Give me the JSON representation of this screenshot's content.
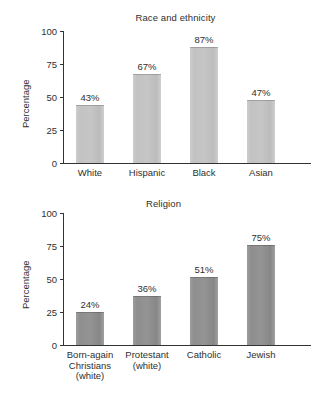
{
  "figure": {
    "background": "#ffffff",
    "axis_color": "#333333",
    "text_color": "#2f2f2f"
  },
  "panels": [
    {
      "id": "race",
      "title": "Race and ethnicity",
      "ylabel": "Percentage",
      "bar_color": "#c4c4c4",
      "ticks": [
        "0",
        "25",
        "50",
        "75",
        "100"
      ],
      "categories": [
        "White",
        "Hispanic",
        "Black",
        "Asian"
      ],
      "values": [
        43,
        67,
        87,
        47
      ],
      "value_labels": [
        "43%",
        "67%",
        "87%",
        "47%"
      ]
    },
    {
      "id": "religion",
      "title": "Religion",
      "ylabel": "Percentage",
      "bar_color": "#909090",
      "ticks": [
        "0",
        "25",
        "50",
        "75",
        "100"
      ],
      "categories": [
        "Born-again\nChristians\n(white)",
        "Protestant\n(white)",
        "Catholic",
        "Jewish"
      ],
      "values": [
        24,
        36,
        51,
        75
      ],
      "value_labels": [
        "24%",
        "36%",
        "51%",
        "75%"
      ]
    }
  ],
  "chart_data": [
    {
      "type": "bar",
      "title": "Race and ethnicity",
      "xlabel": "",
      "ylabel": "Percentage",
      "categories": [
        "White",
        "Hispanic",
        "Black",
        "Asian"
      ],
      "values": [
        43,
        67,
        87,
        47
      ],
      "data_labels": [
        "43%",
        "67%",
        "87%",
        "47%"
      ],
      "ylim": [
        0,
        100
      ],
      "ytick_values": [
        0,
        25,
        50,
        75,
        100
      ],
      "ytick_labels": [
        "0",
        "25",
        "50",
        "75",
        "100"
      ],
      "grid": false,
      "legend": false,
      "bar_color": "#c4c4c4"
    },
    {
      "type": "bar",
      "title": "Religion",
      "xlabel": "",
      "ylabel": "Percentage",
      "categories": [
        "Born-again Christians (white)",
        "Protestant (white)",
        "Catholic",
        "Jewish"
      ],
      "values": [
        24,
        36,
        51,
        75
      ],
      "data_labels": [
        "24%",
        "36%",
        "51%",
        "75%"
      ],
      "ylim": [
        0,
        100
      ],
      "ytick_values": [
        0,
        25,
        50,
        75,
        100
      ],
      "ytick_labels": [
        "0",
        "25",
        "50",
        "75",
        "100"
      ],
      "grid": false,
      "legend": false,
      "bar_color": "#909090"
    }
  ]
}
